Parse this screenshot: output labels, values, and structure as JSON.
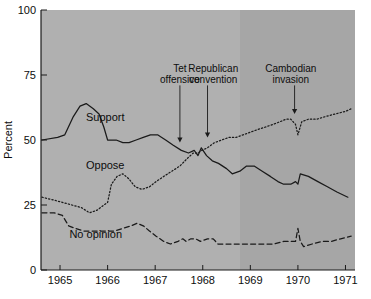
{
  "chart_data": {
    "type": "line",
    "title": "",
    "xlabel": "",
    "ylabel": "Percent",
    "xlim": [
      1964.6,
      1971.2
    ],
    "ylim": [
      0,
      100
    ],
    "grid": false,
    "legend_position": "inline-labels",
    "xticks": [
      "1965",
      "1966",
      "1967",
      "1968",
      "1969",
      "1970",
      "1971"
    ],
    "xtick_values": [
      1965,
      1966,
      1967,
      1968,
      1969,
      1970,
      1971
    ],
    "yticks": [
      "0",
      "25",
      "50",
      "75",
      "100"
    ],
    "ytick_values": [
      0,
      25,
      50,
      75,
      100
    ],
    "series": [
      {
        "name": "Support",
        "style": "solid",
        "color": "#1a1a1a",
        "label_x": 1965.95,
        "label_y": 57.5,
        "points": [
          [
            1964.62,
            50
          ],
          [
            1964.95,
            51
          ],
          [
            1965.1,
            52
          ],
          [
            1965.28,
            59
          ],
          [
            1965.42,
            63
          ],
          [
            1965.55,
            64
          ],
          [
            1965.7,
            62
          ],
          [
            1965.82,
            60
          ],
          [
            1965.92,
            55
          ],
          [
            1966.0,
            50
          ],
          [
            1966.18,
            50
          ],
          [
            1966.32,
            49
          ],
          [
            1966.45,
            49
          ],
          [
            1966.6,
            50
          ],
          [
            1966.75,
            51
          ],
          [
            1966.9,
            52
          ],
          [
            1967.05,
            52
          ],
          [
            1967.22,
            50
          ],
          [
            1967.38,
            48
          ],
          [
            1967.55,
            46
          ],
          [
            1967.7,
            45
          ],
          [
            1967.82,
            46
          ],
          [
            1967.9,
            44
          ],
          [
            1967.97,
            47
          ],
          [
            1968.08,
            44
          ],
          [
            1968.2,
            42
          ],
          [
            1968.33,
            41
          ],
          [
            1968.5,
            39
          ],
          [
            1968.62,
            37
          ],
          [
            1968.78,
            38
          ],
          [
            1968.92,
            40
          ],
          [
            1969.08,
            40
          ],
          [
            1969.25,
            38
          ],
          [
            1969.42,
            36
          ],
          [
            1969.58,
            34
          ],
          [
            1969.7,
            33
          ],
          [
            1969.85,
            33
          ],
          [
            1969.95,
            34
          ],
          [
            1970.0,
            33
          ],
          [
            1970.05,
            37
          ],
          [
            1970.22,
            36
          ],
          [
            1970.42,
            34
          ],
          [
            1970.62,
            32
          ],
          [
            1970.82,
            30
          ],
          [
            1971.05,
            28
          ]
        ]
      },
      {
        "name": "Oppose",
        "style": "dotted",
        "color": "#1a1a1a",
        "label_x": 1965.95,
        "label_y": 39,
        "points": [
          [
            1964.62,
            28
          ],
          [
            1964.85,
            27
          ],
          [
            1965.05,
            26
          ],
          [
            1965.25,
            25
          ],
          [
            1965.45,
            24
          ],
          [
            1965.62,
            22
          ],
          [
            1965.78,
            23
          ],
          [
            1965.92,
            25
          ],
          [
            1966.0,
            26
          ],
          [
            1966.08,
            33
          ],
          [
            1966.2,
            36
          ],
          [
            1966.32,
            37
          ],
          [
            1966.45,
            35
          ],
          [
            1966.58,
            32
          ],
          [
            1966.72,
            31
          ],
          [
            1966.88,
            32
          ],
          [
            1967.02,
            34
          ],
          [
            1967.18,
            36
          ],
          [
            1967.35,
            38
          ],
          [
            1967.52,
            40
          ],
          [
            1967.68,
            43
          ],
          [
            1967.8,
            45
          ],
          [
            1967.9,
            45
          ],
          [
            1967.98,
            46
          ],
          [
            1968.1,
            47
          ],
          [
            1968.25,
            49
          ],
          [
            1968.4,
            50
          ],
          [
            1968.55,
            51
          ],
          [
            1968.7,
            51
          ],
          [
            1968.85,
            52
          ],
          [
            1969.0,
            53
          ],
          [
            1969.15,
            54
          ],
          [
            1969.32,
            55
          ],
          [
            1969.48,
            56
          ],
          [
            1969.62,
            57
          ],
          [
            1969.75,
            58
          ],
          [
            1969.85,
            58
          ],
          [
            1969.95,
            56
          ],
          [
            1970.0,
            52
          ],
          [
            1970.08,
            57
          ],
          [
            1970.22,
            58
          ],
          [
            1970.4,
            58
          ],
          [
            1970.58,
            59
          ],
          [
            1970.78,
            60
          ],
          [
            1971.0,
            61
          ],
          [
            1971.12,
            62
          ]
        ]
      },
      {
        "name": "No opinion",
        "style": "dashed",
        "color": "#1a1a1a",
        "label_x": 1965.75,
        "label_y": 12.5,
        "points": [
          [
            1964.62,
            22
          ],
          [
            1964.88,
            22
          ],
          [
            1965.05,
            21
          ],
          [
            1965.18,
            17
          ],
          [
            1965.32,
            16
          ],
          [
            1965.5,
            15
          ],
          [
            1965.68,
            15
          ],
          [
            1965.85,
            15
          ],
          [
            1966.0,
            15
          ],
          [
            1966.15,
            15
          ],
          [
            1966.32,
            16
          ],
          [
            1966.5,
            17
          ],
          [
            1966.62,
            18
          ],
          [
            1966.75,
            17
          ],
          [
            1966.88,
            15
          ],
          [
            1967.02,
            13
          ],
          [
            1967.18,
            11
          ],
          [
            1967.32,
            10
          ],
          [
            1967.48,
            11
          ],
          [
            1967.58,
            12
          ],
          [
            1967.65,
            11
          ],
          [
            1967.75,
            12
          ],
          [
            1967.85,
            12
          ],
          [
            1967.95,
            11
          ],
          [
            1968.1,
            12
          ],
          [
            1968.22,
            12
          ],
          [
            1968.32,
            10
          ],
          [
            1968.5,
            10
          ],
          [
            1968.7,
            10
          ],
          [
            1968.9,
            10
          ],
          [
            1969.1,
            10
          ],
          [
            1969.3,
            10
          ],
          [
            1969.5,
            10
          ],
          [
            1969.7,
            11
          ],
          [
            1969.85,
            11
          ],
          [
            1969.95,
            11
          ],
          [
            1970.0,
            16
          ],
          [
            1970.05,
            11
          ],
          [
            1970.12,
            9
          ],
          [
            1970.3,
            10
          ],
          [
            1970.5,
            11
          ],
          [
            1970.7,
            11
          ],
          [
            1970.9,
            12
          ],
          [
            1971.12,
            13
          ]
        ]
      }
    ],
    "annotations": [
      {
        "text_line1": "Tet",
        "text_line2": "offensive",
        "text_x": 1967.52,
        "text_y": 76,
        "arrow_x": 1967.52,
        "arrow_y_top": 71,
        "arrow_y_bottom": 49
      },
      {
        "text_line1": "Republican",
        "text_line2": "convention",
        "text_x": 1968.22,
        "text_y": 76,
        "arrow_x": 1968.1,
        "arrow_y_top": 71,
        "arrow_y_bottom": 51
      },
      {
        "text_line1": "Cambodian",
        "text_line2": "invasion",
        "text_x": 1969.85,
        "text_y": 76,
        "arrow_x": 1969.93,
        "arrow_y_top": 71,
        "arrow_y_bottom": 60
      }
    ],
    "plot_background": "#b0b0b0",
    "plot_background_right": "#a6a6a6",
    "axis_color": "#1a1a1a"
  }
}
